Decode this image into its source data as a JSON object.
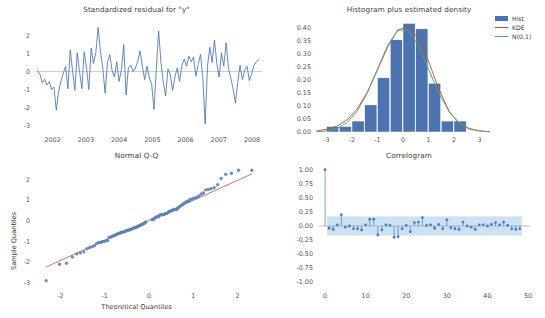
{
  "figure": {
    "title": "",
    "background": "#ffffff",
    "colors": {
      "line_blue": "#4c72b0",
      "hist_bar": "#4c72b0",
      "kde_curve": "#c44e52",
      "normal_curve": "#55a868",
      "reference_line": "#c44e52",
      "marker_blue": "#5a7fb8",
      "zero_line": "#aac4e0",
      "conf_band": "#bdd7ee",
      "tick_text": "#555555",
      "title_text": "#3a3a3a"
    }
  },
  "panels": {
    "residual": {
      "title": "Standardized residual for \"y\"",
      "ylabel": "",
      "xlabel": "",
      "yticks": [
        "2",
        "1",
        "0",
        "-1",
        "-2",
        "-3"
      ],
      "ytick_values": [
        2,
        1,
        0,
        -1,
        -2,
        -3
      ],
      "xticks": [
        "2002",
        "2003",
        "2004",
        "2005",
        "2006",
        "2007",
        "2008"
      ],
      "xtick_values": [
        2002,
        2003,
        2004,
        2005,
        2006,
        2007,
        2008
      ]
    },
    "histogram": {
      "title": "Histogram plus estimated density",
      "yticks": [
        "0.40",
        "0.35",
        "0.30",
        "0.25",
        "0.20",
        "0.15",
        "0.10",
        "0.05",
        "0.00"
      ],
      "ytick_values": [
        0.4,
        0.35,
        0.3,
        0.25,
        0.2,
        0.15,
        0.1,
        0.05,
        0.0
      ],
      "xticks": [
        "-3",
        "-2",
        "-1",
        "0",
        "1",
        "2",
        "3"
      ],
      "xtick_values": [
        -3,
        -2,
        -1,
        0,
        1,
        2,
        3
      ],
      "legend": [
        {
          "label": "Hist",
          "type": "patch",
          "color": "#4c72b0"
        },
        {
          "label": "KDE",
          "type": "line",
          "color": "#c44e52"
        },
        {
          "label": "N(0,1)",
          "type": "line",
          "color": "#55a868"
        }
      ]
    },
    "qq": {
      "title": "Normal Q-Q",
      "ylabel": "Sample Quantiles",
      "xlabel": "Theoretical Quantiles",
      "yticks": [
        "2",
        "1",
        "0",
        "-1",
        "-2",
        "-3"
      ],
      "ytick_values": [
        2,
        1,
        0,
        -1,
        -2,
        -3
      ],
      "xticks": [
        "-2",
        "-1",
        "0",
        "1",
        "2"
      ],
      "xtick_values": [
        -2,
        -1,
        0,
        1,
        2
      ]
    },
    "correlogram": {
      "title": "Correlogram",
      "yticks": [
        "1.00",
        "0.75",
        "0.50",
        "0.25",
        "0.00",
        "-0.25",
        "-0.50",
        "-0.75",
        "-1.00"
      ],
      "ytick_values": [
        1.0,
        0.75,
        0.5,
        0.25,
        0.0,
        -0.25,
        -0.5,
        -0.75,
        -1.0
      ],
      "xticks": [
        "0",
        "10",
        "20",
        "30",
        "40",
        "50"
      ],
      "xtick_values": [
        0,
        10,
        20,
        30,
        40,
        50
      ]
    }
  },
  "chart_data": [
    {
      "type": "line",
      "id": "standardized-residual",
      "title": "Standardized residual for \"y\"",
      "xlabel": "",
      "ylabel": "",
      "xlim": [
        2001.5,
        2008.3
      ],
      "ylim": [
        -3.35,
        2.75
      ],
      "grid": false,
      "legend": null,
      "hline": 0,
      "x": [
        2001.55,
        2001.62,
        2001.69,
        2001.76,
        2001.83,
        2001.9,
        2001.97,
        2002.04,
        2002.11,
        2002.18,
        2002.25,
        2002.32,
        2002.39,
        2002.46,
        2002.53,
        2002.6,
        2002.67,
        2002.74,
        2002.81,
        2002.88,
        2002.95,
        2003.02,
        2003.09,
        2003.16,
        2003.23,
        2003.3,
        2003.37,
        2003.44,
        2003.51,
        2003.58,
        2003.65,
        2003.72,
        2003.79,
        2003.86,
        2003.93,
        2004.0,
        2004.07,
        2004.14,
        2004.21,
        2004.28,
        2004.35,
        2004.42,
        2004.49,
        2004.56,
        2004.63,
        2004.7,
        2004.77,
        2004.84,
        2004.91,
        2004.98,
        2005.05,
        2005.12,
        2005.19,
        2005.26,
        2005.33,
        2005.4,
        2005.47,
        2005.54,
        2005.61,
        2005.68,
        2005.75,
        2005.82,
        2005.89,
        2005.96,
        2006.03,
        2006.1,
        2006.17,
        2006.24,
        2006.31,
        2006.38,
        2006.45,
        2006.52,
        2006.59,
        2006.66,
        2006.73,
        2006.8,
        2006.87,
        2006.94,
        2007.01,
        2007.08,
        2007.15,
        2007.22,
        2007.29,
        2007.36,
        2007.43,
        2007.5,
        2007.57,
        2007.64,
        2007.71,
        2007.78,
        2007.85,
        2007.92,
        2007.99,
        2008.06,
        2008.13,
        2008.2
      ],
      "y": [
        0.05,
        -0.15,
        -0.62,
        -0.42,
        -0.75,
        -0.55,
        -1.0,
        -0.85,
        -2.15,
        -1.1,
        -0.55,
        -0.1,
        0.3,
        -0.95,
        1.2,
        0.05,
        -1.05,
        1.05,
        0.0,
        -0.95,
        1.1,
        0.2,
        -1.0,
        1.3,
        0.45,
        1.05,
        2.45,
        1.1,
        0.2,
        -1.2,
        0.5,
        0.95,
        0.05,
        -0.3,
        0.55,
        -0.55,
        0.1,
        1.5,
        -1.3,
        0.2,
        0.35,
        0.0,
        0.2,
        0.55,
        1.15,
        0.3,
        -0.45,
        0.3,
        -0.35,
        -0.7,
        -2.1,
        0.15,
        2.25,
        0.5,
        -0.6,
        -1.35,
        0.15,
        -0.15,
        -1.05,
        -0.3,
        0.2,
        -0.55,
        0.35,
        0.7,
        0.3,
        0.85,
        0.55,
        0.8,
        -0.25,
        0.4,
        0.95,
        -0.35,
        -2.9,
        0.3,
        1.35,
        0.5,
        1.75,
        0.45,
        -0.3,
        1.05,
        0.3,
        1.6,
        0.2,
        -0.35,
        -0.95,
        -1.75,
        -0.6,
        0.35,
        -0.45,
        0.1,
        0.3,
        -0.5,
        -0.1,
        0.35,
        0.55,
        0.65
      ]
    },
    {
      "type": "bar",
      "id": "residual-histogram",
      "title": "Histogram plus estimated density",
      "xlabel": "",
      "ylabel": "",
      "xlim": [
        -3.45,
        3.45
      ],
      "ylim": [
        0.0,
        0.43
      ],
      "grid": false,
      "legend_position": "upper right",
      "bin_edges": [
        -3.0,
        -2.5,
        -2.0,
        -1.5,
        -1.0,
        -0.5,
        0.0,
        0.5,
        1.0,
        1.5,
        2.0,
        2.5
      ],
      "categories": [
        "-3.0..-2.5",
        "-2.5..-2.0",
        "-2.0..-1.5",
        "-1.5..-1.0",
        "-1.0..-0.5",
        "-0.5..0.0",
        "0.0..0.5",
        "0.5..1.0",
        "1.0..1.5",
        "1.5..2.0",
        "2.0..2.5"
      ],
      "values": [
        0.021,
        0.021,
        0.042,
        0.104,
        0.208,
        0.354,
        0.417,
        0.396,
        0.187,
        0.042,
        0.042
      ],
      "series": [
        {
          "name": "KDE",
          "type": "line",
          "color": "#c44e52",
          "x": [
            -3.4,
            -3.0,
            -2.6,
            -2.2,
            -1.8,
            -1.4,
            -1.0,
            -0.6,
            -0.2,
            0.2,
            0.6,
            1.0,
            1.4,
            1.8,
            2.2,
            2.6,
            3.0,
            3.4
          ],
          "y": [
            0.004,
            0.01,
            0.022,
            0.046,
            0.088,
            0.153,
            0.238,
            0.327,
            0.392,
            0.405,
            0.361,
            0.272,
            0.166,
            0.081,
            0.032,
            0.011,
            0.004,
            0.001
          ]
        },
        {
          "name": "N(0,1)",
          "type": "line",
          "color": "#55a868",
          "x": [
            -3.4,
            -3.0,
            -2.6,
            -2.2,
            -1.8,
            -1.4,
            -1.0,
            -0.6,
            -0.2,
            0.2,
            0.6,
            1.0,
            1.4,
            1.8,
            2.2,
            2.6,
            3.0,
            3.4
          ],
          "y": [
            0.001,
            0.004,
            0.014,
            0.035,
            0.079,
            0.15,
            0.242,
            0.333,
            0.391,
            0.391,
            0.333,
            0.242,
            0.15,
            0.079,
            0.035,
            0.014,
            0.004,
            0.001
          ]
        }
      ]
    },
    {
      "type": "scatter",
      "id": "normal-qq",
      "title": "Normal Q-Q",
      "xlabel": "Theoretical Quantiles",
      "ylabel": "Sample Quantiles",
      "xlim": [
        -2.55,
        2.55
      ],
      "ylim": [
        -3.25,
        2.75
      ],
      "grid": false,
      "reference_line": {
        "slope": 0.97,
        "intercept": 0.02,
        "color": "#c44e52"
      },
      "theoretical": [
        -2.32,
        -2.02,
        -1.86,
        -1.73,
        -1.63,
        -1.55,
        -1.47,
        -1.4,
        -1.34,
        -1.28,
        -1.23,
        -1.18,
        -1.13,
        -1.09,
        -1.05,
        -1.01,
        -0.97,
        -0.93,
        -0.9,
        -0.86,
        -0.83,
        -0.8,
        -0.76,
        -0.73,
        -0.7,
        -0.67,
        -0.64,
        -0.62,
        -0.59,
        -0.56,
        -0.53,
        -0.51,
        -0.48,
        -0.45,
        -0.43,
        -0.4,
        -0.38,
        -0.35,
        -0.33,
        -0.3,
        -0.28,
        -0.25,
        -0.23,
        -0.21,
        -0.18,
        -0.16,
        -0.14,
        -0.11,
        -0.09,
        -0.07,
        0.07,
        0.09,
        0.11,
        0.14,
        0.16,
        0.18,
        0.21,
        0.23,
        0.25,
        0.28,
        0.3,
        0.33,
        0.35,
        0.38,
        0.4,
        0.43,
        0.45,
        0.48,
        0.51,
        0.53,
        0.56,
        0.59,
        0.62,
        0.64,
        0.67,
        0.7,
        0.73,
        0.76,
        0.8,
        0.83,
        0.86,
        0.9,
        0.93,
        0.97,
        1.01,
        1.05,
        1.09,
        1.13,
        1.18,
        1.23,
        1.28,
        1.34,
        1.4,
        1.47,
        1.55,
        1.63,
        1.73,
        1.86,
        2.02,
        2.32
      ],
      "sample": [
        -2.9,
        -2.1,
        -2.05,
        -1.75,
        -1.6,
        -1.55,
        -1.5,
        -1.35,
        -1.3,
        -1.25,
        -1.2,
        -1.1,
        -1.05,
        -1.05,
        -1.0,
        -1.0,
        -0.95,
        -0.95,
        -0.8,
        -0.78,
        -0.75,
        -0.72,
        -0.7,
        -0.65,
        -0.62,
        -0.6,
        -0.58,
        -0.55,
        -0.55,
        -0.52,
        -0.5,
        -0.48,
        -0.45,
        -0.45,
        -0.42,
        -0.4,
        -0.38,
        -0.35,
        -0.35,
        -0.32,
        -0.3,
        -0.28,
        -0.25,
        -0.22,
        -0.2,
        -0.18,
        -0.15,
        -0.12,
        -0.1,
        -0.05,
        0.05,
        0.08,
        0.1,
        0.15,
        0.18,
        0.2,
        0.2,
        0.25,
        0.28,
        0.3,
        0.3,
        0.3,
        0.33,
        0.35,
        0.35,
        0.4,
        0.45,
        0.45,
        0.5,
        0.5,
        0.55,
        0.55,
        0.55,
        0.6,
        0.65,
        0.7,
        0.75,
        0.8,
        0.85,
        0.9,
        0.95,
        0.95,
        1.05,
        1.05,
        1.1,
        1.1,
        1.15,
        1.2,
        1.3,
        1.35,
        1.5,
        1.52,
        1.55,
        1.6,
        1.75,
        2.05,
        2.25,
        2.3,
        2.45,
        2.45
      ]
    },
    {
      "type": "line",
      "id": "correlogram",
      "title": "Correlogram",
      "xlabel": "",
      "ylabel": "",
      "xlim": [
        -1.5,
        50.5
      ],
      "ylim": [
        -1.1,
        1.1
      ],
      "grid": false,
      "confidence_band": {
        "upper": 0.17,
        "lower": -0.17,
        "color": "#bdd7ee",
        "start_lag": 1
      },
      "lags": [
        0,
        1,
        2,
        3,
        4,
        5,
        6,
        7,
        8,
        9,
        10,
        11,
        12,
        13,
        14,
        15,
        16,
        17,
        18,
        19,
        20,
        21,
        22,
        23,
        24,
        25,
        26,
        27,
        28,
        29,
        30,
        31,
        32,
        33,
        34,
        35,
        36,
        37,
        38,
        39,
        40,
        41,
        42,
        43,
        44,
        45,
        46,
        47,
        48
      ],
      "acf": [
        1.0,
        -0.04,
        -0.06,
        0.02,
        0.2,
        -0.02,
        0.0,
        -0.05,
        -0.05,
        -0.07,
        0.02,
        0.12,
        0.12,
        -0.16,
        -0.07,
        0.02,
        0.01,
        -0.2,
        -0.19,
        -0.05,
        0.01,
        -0.1,
        0.06,
        0.07,
        0.15,
        0.01,
        0.02,
        -0.04,
        0.03,
        -0.05,
        0.11,
        -0.03,
        -0.05,
        -0.06,
        0.07,
        0.0,
        -0.02,
        -0.06,
        0.02,
        0.02,
        0.0,
        0.03,
        0.06,
        0.02,
        0.07,
        0.01,
        -0.05,
        -0.06,
        -0.05
      ]
    }
  ]
}
